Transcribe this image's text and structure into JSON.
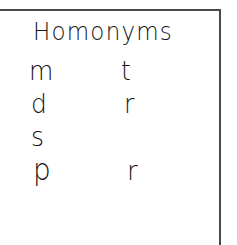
{
  "page": {
    "title": "Homonyms",
    "background_color": "#ffffff",
    "ink_color": "#151515",
    "rule_color": "#4a4a4a"
  },
  "rules": {
    "top_rule_name": "horizontal rule",
    "right_rule_name": "vertical rule"
  },
  "list": {
    "rows": [
      {
        "left": "m",
        "right": "t"
      },
      {
        "left": "d",
        "right": "r"
      },
      {
        "left": "s",
        "right": ""
      },
      {
        "left": "p",
        "right": "r"
      }
    ]
  }
}
